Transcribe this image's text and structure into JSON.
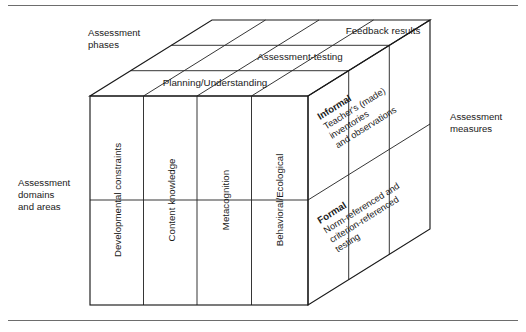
{
  "figure": {
    "title_hidden": "Three-dimensional assessment model cube",
    "axes": {
      "top_axis_label": "Assessment\nphases",
      "top_axis_label_lines": [
        "Assessment",
        "phases"
      ],
      "left_axis_label_lines": [
        "Assessment",
        "domains",
        "and areas"
      ],
      "right_axis_label_lines": [
        "Assessment",
        "measures"
      ]
    },
    "top_face_bands": [
      {
        "id": "band-feedback",
        "label": "Feedback results"
      },
      {
        "id": "band-assessment-testing",
        "label": "Assessment-testing"
      },
      {
        "id": "band-planning",
        "label": "Planning/Understanding"
      }
    ],
    "front_face_columns": [
      {
        "id": "col-developmental",
        "label": "Developmental constraints"
      },
      {
        "id": "col-content",
        "label": "Content knowledge"
      },
      {
        "id": "col-metacognition",
        "label": "Metacognition"
      },
      {
        "id": "col-behavioral",
        "label": "Behavioral/Ecological"
      }
    ],
    "right_face_sections": [
      {
        "id": "section-informal",
        "heading": "Informal",
        "detail_lines": [
          "Teacher's (made)",
          "inventories",
          "and observations"
        ]
      },
      {
        "id": "section-formal",
        "heading": "Formal",
        "detail_lines": [
          "Norm-referenced and",
          "criterion-referenced",
          "testing"
        ]
      }
    ],
    "colors": {
      "background": "#ffffff",
      "edge_stroke": "#1a1a1a",
      "inner_stroke": "#2b2b2b",
      "rule_stroke": "#6d6d6d",
      "text": "#1a1a1a"
    }
  }
}
